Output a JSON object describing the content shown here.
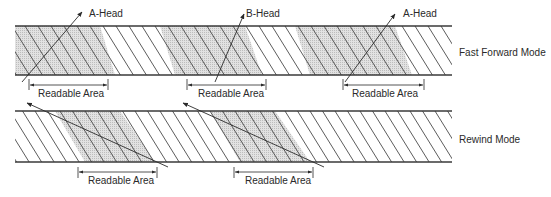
{
  "diagram": {
    "modes": [
      {
        "id": "fast-forward",
        "label": "Fast Forward Mode",
        "heads": [
          {
            "label": "A-Head"
          },
          {
            "label": "B-Head"
          },
          {
            "label": "A-Head"
          }
        ],
        "readable_areas": [
          {
            "label": "Readable Area"
          },
          {
            "label": "Readable Area"
          },
          {
            "label": "Readable Area"
          }
        ]
      },
      {
        "id": "rewind",
        "label": "Rewind Mode",
        "readable_areas": [
          {
            "label": "Readable Area"
          },
          {
            "label": "Readable Area"
          }
        ]
      }
    ]
  },
  "colors": {
    "line": "#3a3a3a",
    "shade": "#d9d9d9"
  }
}
